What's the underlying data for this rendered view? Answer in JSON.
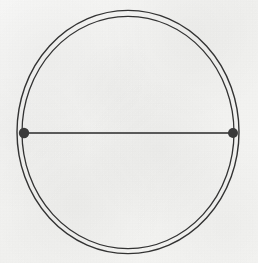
{
  "figure": {
    "medium": "hand-drawn ink on textured paper (scanned)",
    "canvas": {
      "width": 258,
      "height": 263
    },
    "background_color": "#f6f6f4",
    "ink_color": "#2b2b2b",
    "shapes": {
      "circle": {
        "label": "circle-outline",
        "center_x": 128,
        "center_y": 132,
        "radius_outer": 111,
        "radius_inner": 106,
        "stroke_style": "double-line",
        "stroke_width": 1.4,
        "stroke_color": "#333333",
        "fill": "none"
      },
      "chord": {
        "label": "horizontal-diameter",
        "x1": 24,
        "y1": 133,
        "x2": 233,
        "y2": 133,
        "stroke_width": 1.5,
        "stroke_color": "#2a2a2a",
        "length": 209
      },
      "endpoints": [
        {
          "label": "left-endpoint",
          "cx": 24,
          "cy": 133,
          "r": 5.2,
          "fill": "#3a3a3a"
        },
        {
          "label": "right-endpoint",
          "cx": 233,
          "cy": 133,
          "r": 5.0,
          "fill": "#3a3a3a"
        }
      ]
    }
  }
}
